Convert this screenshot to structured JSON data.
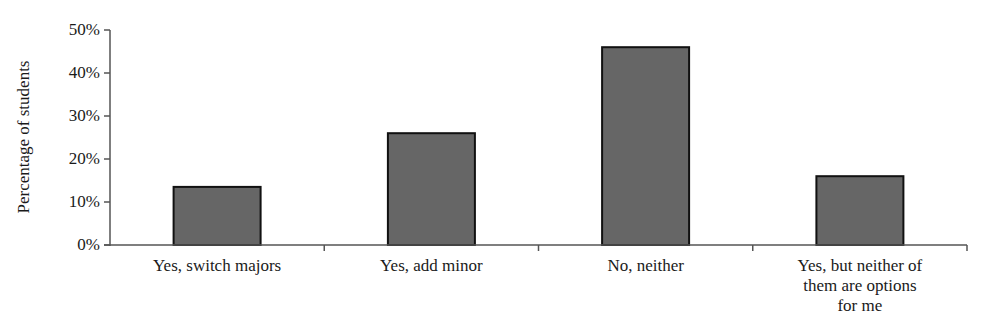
{
  "chart_data": {
    "type": "bar",
    "title": "",
    "xlabel": "",
    "ylabel": "Percentage of students",
    "categories": [
      "Yes, switch majors",
      "Yes, add minor",
      "No, neither",
      "Yes, but neither of them are options for me"
    ],
    "category_label_lines": [
      [
        "Yes, switch majors"
      ],
      [
        "Yes, add minor"
      ],
      [
        "No, neither"
      ],
      [
        "Yes, but neither of",
        "them are options",
        "for me"
      ]
    ],
    "values": [
      13.5,
      26,
      46,
      16
    ],
    "value_format": "percent",
    "ylim": [
      0,
      50
    ],
    "yticks": [
      0,
      10,
      20,
      30,
      40,
      50
    ],
    "ytick_labels": [
      "0%",
      "10%",
      "20%",
      "30%",
      "40%",
      "50%"
    ],
    "grid": false,
    "legend": null,
    "colors": {
      "bar_fill": "#666666",
      "bar_edge": "#111111",
      "axis": "#555555",
      "text": "#1a1a1a"
    }
  }
}
